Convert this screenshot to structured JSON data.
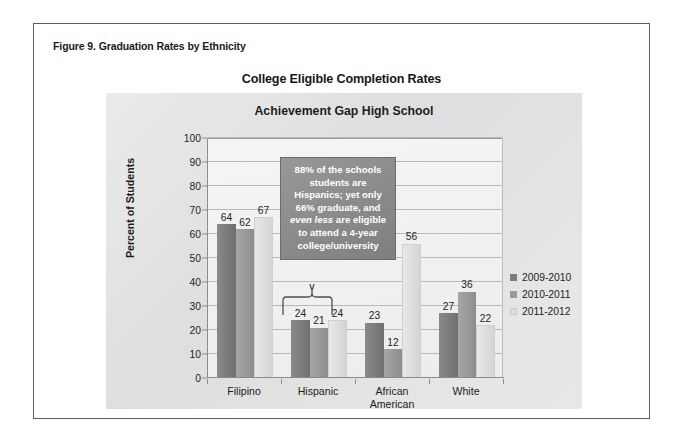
{
  "figure": {
    "caption": "Figure 9. Graduation Rates by Ethnicity",
    "outer_title": "College Eligible Completion Rates",
    "inner_title": "Achievement Gap High School"
  },
  "callout": {
    "line1": "88% of the schools",
    "line2": "students are",
    "line3": "Hispanics; yet only",
    "line4": "66% graduate, and",
    "line5_italic": "even less",
    "line5_rest": " are eligible",
    "line6": "to attend a 4-year",
    "line7": "college/university"
  },
  "colors": {
    "series_2009_2010": "#7c7c7c",
    "series_2010_2011": "#9a9a9a",
    "series_2011_2012": "#dedede",
    "panel_background": "#e2e2e2",
    "plot_background": "#ececec",
    "callout_background": "#8c8c8c",
    "figure_border": "#5c5c5c"
  },
  "chart_data": {
    "type": "bar",
    "title": "Achievement Gap High School",
    "subtitle": "College Eligible Completion Rates",
    "xlabel": "",
    "ylabel": "Percent of Students",
    "ylim": [
      0,
      100
    ],
    "ytick_step": 10,
    "yticks": [
      0,
      10,
      20,
      30,
      40,
      50,
      60,
      70,
      80,
      90,
      100
    ],
    "ytick_labels": [
      "0",
      "10",
      "20",
      "30",
      "40",
      "50",
      "60",
      "70",
      "80",
      "90",
      "100"
    ],
    "grid": "horizontal",
    "legend_position": "right",
    "categories": [
      "Filipino",
      "Hispanic",
      "African American",
      "White"
    ],
    "category_lines": [
      [
        "Filipino"
      ],
      [
        "Hispanic"
      ],
      [
        "African",
        "American"
      ],
      [
        "White"
      ]
    ],
    "series": [
      {
        "name": "2009-2010",
        "values": [
          64,
          24,
          23,
          27
        ],
        "color": "#7c7c7c"
      },
      {
        "name": "2010-2011",
        "values": [
          62,
          21,
          12,
          36
        ],
        "color": "#9a9a9a"
      },
      {
        "name": "2011-2012",
        "values": [
          67,
          24,
          56,
          22
        ],
        "color": "#dedede"
      }
    ],
    "data_labels": [
      {
        "category": "Filipino",
        "series": "2009-2010",
        "value": 64
      },
      {
        "category": "Filipino",
        "series": "2010-2011",
        "value": 62
      },
      {
        "category": "Filipino",
        "series": "2011-2012",
        "value": 67
      },
      {
        "category": "Hispanic",
        "series": "2009-2010",
        "value": 24
      },
      {
        "category": "Hispanic",
        "series": "2010-2011",
        "value": 21
      },
      {
        "category": "Hispanic",
        "series": "2011-2012",
        "value": 24
      },
      {
        "category": "African American",
        "series": "2009-2010",
        "value": 23
      },
      {
        "category": "African American",
        "series": "2010-2011",
        "value": 12
      },
      {
        "category": "African American",
        "series": "2011-2012",
        "value": 56
      },
      {
        "category": "White",
        "series": "2009-2010",
        "value": 27
      },
      {
        "category": "White",
        "series": "2010-2011",
        "value": 36
      },
      {
        "category": "White",
        "series": "2011-2012",
        "value": 22
      }
    ],
    "annotations": [
      {
        "type": "callout",
        "target_category": "Hispanic",
        "text": "88% of the schools students are Hispanics; yet only 66% graduate, and even less are eligible to attend a 4-year college/university"
      }
    ]
  }
}
